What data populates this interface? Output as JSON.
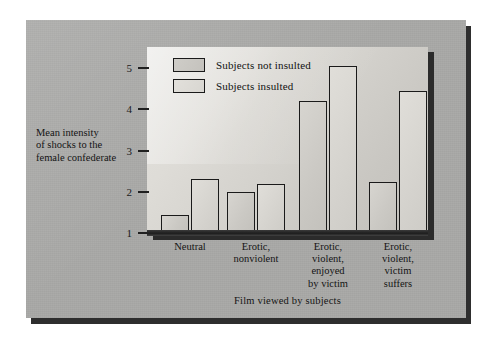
{
  "chart_data": {
    "type": "bar",
    "title": "",
    "xlabel": "Film viewed by subjects",
    "ylabel": "Mean intensity of shocks to the female confederate",
    "ylabel_lines": [
      "Mean intensity",
      "of shocks to the",
      "female confederate"
    ],
    "categories": [
      "Neutral",
      "Erotic, nonviolent",
      "Erotic, violent, enjoyed by victim",
      "Erotic, violent, victim suffers"
    ],
    "category_lines": [
      [
        "Neutral"
      ],
      [
        "Erotic,",
        "nonviolent"
      ],
      [
        "Erotic,",
        "violent,",
        "enjoyed",
        "by victim"
      ],
      [
        "Erotic,",
        "violent,",
        "victim",
        "suffers"
      ]
    ],
    "series": [
      {
        "name": "Subjects not insulted",
        "values": [
          1.4,
          1.95,
          4.15,
          2.2
        ]
      },
      {
        "name": "Subjects insulted",
        "values": [
          2.25,
          2.15,
          5.0,
          4.4
        ]
      }
    ],
    "yticks": [
      1,
      2,
      3,
      4,
      5
    ],
    "ylim": [
      1,
      5.3
    ],
    "grid": false,
    "legend_position": "top-left-inside"
  },
  "legend": {
    "entries": [
      {
        "label": "Subjects not insulted"
      },
      {
        "label": "Subjects insulted"
      }
    ]
  },
  "axes": {
    "y_title_lines": [
      "Mean intensity",
      "of shocks to the",
      "female confederate"
    ],
    "x_title": "Film viewed by subjects",
    "y_ticks": [
      "1",
      "2",
      "3",
      "4",
      "5"
    ]
  },
  "colors": {
    "card_background": "#a9a9a7",
    "panel_light": "#e3e2de",
    "panel_dark": "#c2c0bb",
    "bar_outline": "#1a1a1a",
    "bar_not_insulted": "#cbc9c4",
    "bar_insulted": "#d6d4cf",
    "shadow": "#2b2b2b",
    "text": "#141414"
  }
}
